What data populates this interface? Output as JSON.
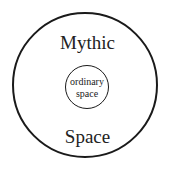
{
  "diagram": {
    "outer_circle": {
      "label_top": "Mythic",
      "label_bottom": "Space",
      "stroke_color": "#1a1a1a"
    },
    "inner_circle": {
      "line1": "ordinary",
      "line2": "space",
      "stroke_color": "#1a1a1a"
    },
    "background_color": "#ffffff"
  }
}
